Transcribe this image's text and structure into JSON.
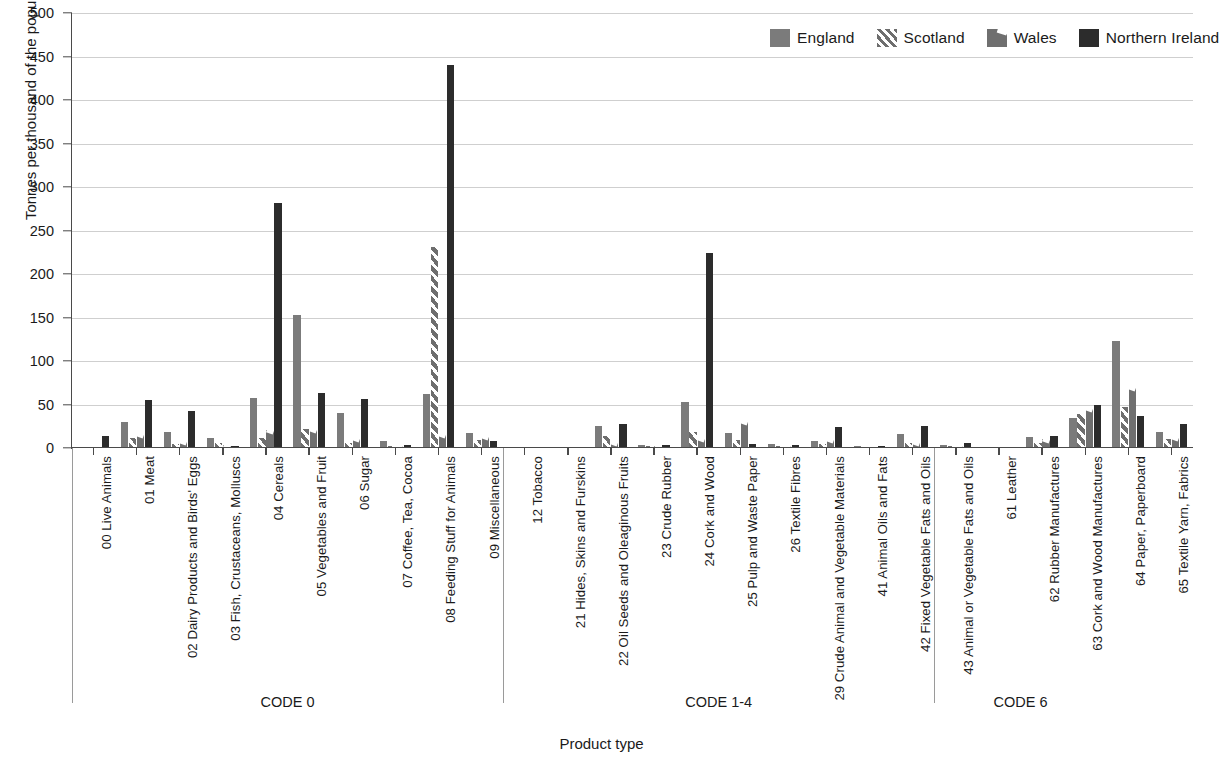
{
  "legend": {
    "items": [
      {
        "label": "England",
        "key": "england",
        "color": "#7b7b7b",
        "icon": "swatch-solid-icon"
      },
      {
        "label": "Scotland",
        "key": "scotland",
        "color": "#6e6e6e",
        "icon": "swatch-hatched-icon"
      },
      {
        "label": "Wales",
        "key": "wales",
        "color": "#6f6f6f",
        "icon": "swatch-notched-icon"
      },
      {
        "label": "Northern Ireland",
        "key": "nireland",
        "color": "#2c2c2c",
        "icon": "swatch-dark-icon"
      }
    ]
  },
  "code_bands": [
    {
      "label": "CODE 0",
      "start": 0,
      "end": 10
    },
    {
      "label": "CODE 1-4",
      "start": 10,
      "end": 20
    },
    {
      "label": "CODE 6",
      "start": 20,
      "end": 24
    }
  ],
  "chart_data": {
    "type": "bar",
    "title": "",
    "xlabel": "Product type",
    "ylabel": "Tonnes per thousand of the population",
    "ylim": [
      0,
      500
    ],
    "yticks": [
      0,
      50,
      100,
      150,
      200,
      250,
      300,
      350,
      400,
      450,
      500
    ],
    "grid": true,
    "legend_position": "top-right",
    "categories": [
      "00 Live Animals",
      "01 Meat",
      "02 Dairy Products and Birds' Eggs",
      "03 Fish, Crustaceans, Molluscs",
      "04 Cereals",
      "05 Vegetables and Fruit",
      "06 Sugar",
      "07 Coffee, Tea, Cocoa",
      "08 Feeding Stuff for Animals",
      "09 Miscellaneous",
      "12 Tobacco",
      "21 Hides, Skins and Furskins",
      "22 Oil Seeds and Oleaginous Fruits",
      "23 Crude Rubber",
      "24 Cork and Wood",
      "25 Pulp and Waste Paper",
      "26 Textile Fibres",
      "29 Crude Animal and Vegetable Materials",
      "41 Animal Oils and Fats",
      "42 Fixed Vegetable Fats and Oils",
      "43 Animal or Vegetable Fats and Oils",
      "61 Leather",
      "62 Rubber Manufactures",
      "63 Cork and Wood Manufactures",
      "64 Paper, Paperboard",
      "65 Textile Yarn, Fabrics"
    ],
    "series": [
      {
        "name": "England",
        "key": "england",
        "color": "#7b7b7b",
        "values": [
          1,
          30,
          18,
          12,
          58,
          153,
          40,
          8,
          62,
          17,
          1,
          1,
          25,
          3,
          53,
          17,
          5,
          8,
          2,
          16,
          4,
          0,
          13,
          34,
          123,
          18
        ]
      },
      {
        "name": "Scotland",
        "key": "scotland",
        "color": "#6e6e6e",
        "values": [
          1,
          12,
          5,
          6,
          12,
          22,
          6,
          2,
          231,
          9,
          0,
          1,
          14,
          2,
          18,
          9,
          2,
          5,
          1,
          6,
          2,
          0,
          6,
          39,
          47,
          10
        ]
      },
      {
        "name": "Wales",
        "key": "wales",
        "color": "#6f6f6f",
        "values": [
          2,
          16,
          8,
          3,
          21,
          22,
          11,
          3,
          16,
          14,
          0,
          1,
          7,
          2,
          11,
          31,
          3,
          10,
          1,
          7,
          3,
          0,
          10,
          46,
          70,
          13
        ]
      },
      {
        "name": "Northern Ireland",
        "key": "nireland",
        "color": "#2c2c2c",
        "values": [
          14,
          55,
          43,
          2,
          282,
          63,
          56,
          4,
          440,
          8,
          1,
          1,
          28,
          3,
          224,
          5,
          4,
          24,
          2,
          25,
          6,
          0,
          14,
          49,
          37,
          28
        ]
      }
    ]
  }
}
